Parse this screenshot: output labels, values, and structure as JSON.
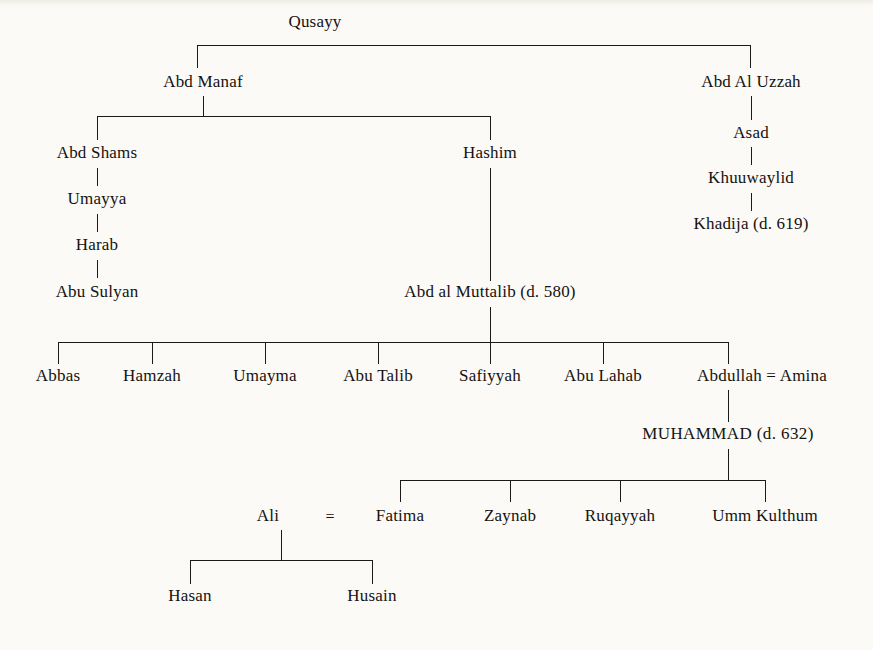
{
  "diagram": {
    "type": "family-tree",
    "background_color": "#fbfaf7",
    "line_color": "#1a1a1a",
    "text_color": "#15120f",
    "generations": [
      {
        "level": 0,
        "people": [
          {
            "id": "qusayy",
            "label": "Qusayy"
          }
        ]
      },
      {
        "level": 1,
        "people": [
          {
            "id": "abd_manaf",
            "label": "Abd Manaf"
          },
          {
            "id": "abd_al_uzzah",
            "label": "Abd Al Uzzah"
          }
        ]
      },
      {
        "level": 2,
        "people": [
          {
            "id": "abd_shams",
            "label": "Abd Shams"
          },
          {
            "id": "hashim",
            "label": "Hashim"
          },
          {
            "id": "asad",
            "label": "Asad"
          }
        ]
      },
      {
        "level": 3,
        "people": [
          {
            "id": "umayya",
            "label": "Umayya"
          },
          {
            "id": "khuuwaylid",
            "label": "Khuuwaylid"
          }
        ]
      },
      {
        "level": 4,
        "people": [
          {
            "id": "harab",
            "label": "Harab"
          },
          {
            "id": "khadija",
            "label": "Khadija (d. 619)"
          }
        ]
      },
      {
        "level": 5,
        "people": [
          {
            "id": "abu_sulyan",
            "label": "Abu Sulyan"
          },
          {
            "id": "abd_al_muttalib",
            "label": "Abd al Muttalib (d. 580)"
          }
        ]
      },
      {
        "level": 6,
        "people": [
          {
            "id": "abbas",
            "label": "Abbas"
          },
          {
            "id": "hamzah",
            "label": "Hamzah"
          },
          {
            "id": "umayma",
            "label": "Umayma"
          },
          {
            "id": "abu_talib",
            "label": "Abu Talib"
          },
          {
            "id": "safiyyah",
            "label": "Safiyyah"
          },
          {
            "id": "abu_lahab",
            "label": "Abu Lahab"
          },
          {
            "id": "abdullah",
            "label": "Abdullah"
          },
          {
            "id": "amina",
            "label": "Amina"
          }
        ]
      },
      {
        "level": 7,
        "people": [
          {
            "id": "muhammad",
            "label": "MUHAMMAD (d. 632)"
          }
        ]
      },
      {
        "level": 8,
        "people": [
          {
            "id": "ali",
            "label": "Ali"
          },
          {
            "id": "fatima",
            "label": "Fatima"
          },
          {
            "id": "zaynab",
            "label": "Zaynab"
          },
          {
            "id": "ruqayyah",
            "label": "Ruqayyah"
          },
          {
            "id": "umm_kulthum",
            "label": "Umm Kulthum"
          }
        ]
      },
      {
        "level": 9,
        "people": [
          {
            "id": "hasan",
            "label": "Hasan"
          },
          {
            "id": "husain",
            "label": "Husain"
          }
        ]
      }
    ],
    "marriage_symbol": "=",
    "marriages": [
      {
        "left": "Abdullah",
        "right": "Amina",
        "symbol": "="
      },
      {
        "left": "Ali",
        "right": "Fatima",
        "symbol": "="
      }
    ],
    "labels": {
      "qusayy": "Qusayy",
      "abd_manaf": "Abd Manaf",
      "abd_al_uzzah": "Abd Al Uzzah",
      "abd_shams": "Abd Shams",
      "hashim": "Hashim",
      "asad": "Asad",
      "umayya": "Umayya",
      "khuuwaylid": "Khuuwaylid",
      "harab": "Harab",
      "khadija": "Khadija (d. 619)",
      "abu_sulyan": "Abu Sulyan",
      "abd_al_muttalib": "Abd al Muttalib (d. 580)",
      "abbas": "Abbas",
      "hamzah": "Hamzah",
      "umayma": "Umayma",
      "abu_talib": "Abu Talib",
      "safiyyah": "Safiyyah",
      "abu_lahab": "Abu Lahab",
      "abdullah_amina": "Abdullah = Amina",
      "muhammad": "MUHAMMAD (d. 632)",
      "ali": "Ali",
      "eq_ali_fatima": "=",
      "fatima": "Fatima",
      "zaynab": "Zaynab",
      "ruqayyah": "Ruqayyah",
      "umm_kulthum": "Umm Kulthum",
      "hasan": "Hasan",
      "husain": "Husain"
    }
  }
}
